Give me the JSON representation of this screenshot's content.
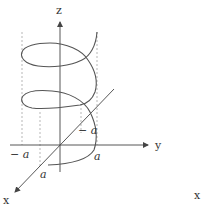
{
  "figure": {
    "type": "3d-helix-diagram",
    "axes": {
      "z_label": "z",
      "y_label": "y",
      "x_label": "x",
      "stray_label": "x"
    },
    "tick_labels": {
      "y_neg": "− a",
      "y_pos": "a",
      "x_neg": "− a",
      "x_pos": "a"
    },
    "colors": {
      "stroke": "#555555",
      "dashed": "#999999",
      "text": "#333333"
    }
  }
}
